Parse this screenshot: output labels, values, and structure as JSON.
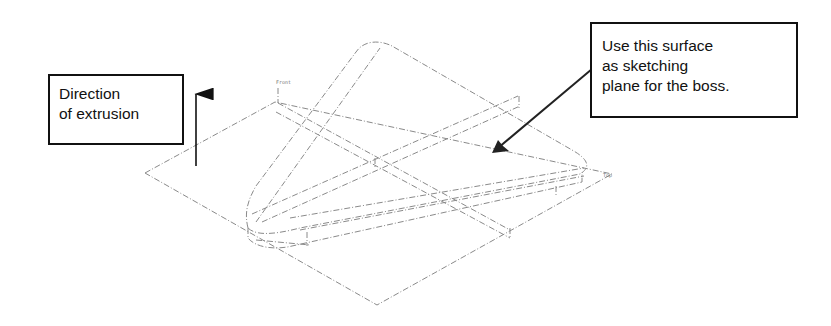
{
  "callouts": {
    "direction": {
      "lines": [
        "Direction",
        "of extrusion"
      ]
    },
    "surface": {
      "lines": [
        "Use this surface",
        "as sketching",
        "plane for the boss."
      ]
    }
  },
  "plane_labels": {
    "front": "Front",
    "top": "Top"
  },
  "colors": {
    "ink": "#111111",
    "construction_line": "#888888"
  }
}
